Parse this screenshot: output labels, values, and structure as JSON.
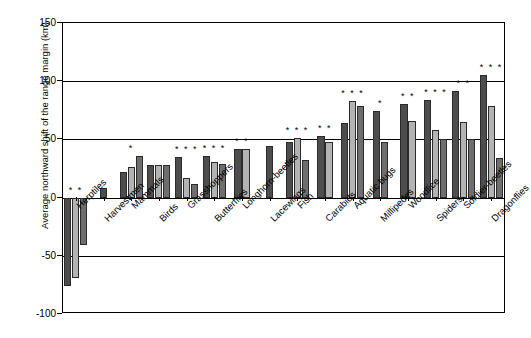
{
  "chart_data": {
    "type": "bar",
    "title": "",
    "xlabel": "",
    "ylabel": "Average northward shift of the range margin (km)",
    "ylim": [
      -100,
      150
    ],
    "yticks": [
      150,
      100,
      50,
      0,
      -50,
      -100
    ],
    "grid": true,
    "legend_position": "none",
    "categories": [
      "Herptiles",
      "Harvestmen",
      "Mammals",
      "Birds",
      "Grasshoppers",
      "Butterflies",
      "Longhorn-beetles",
      "Lacewings",
      "Fish",
      "Carabids",
      "Aquatic bugs",
      "Millipedes",
      "Woodlice",
      "Spiders",
      "Soldier-beetles",
      "Dragonflies"
    ],
    "series": [
      {
        "name": "bar-1",
        "shade": "dark",
        "values": [
          -76,
          8,
          22,
          28,
          35,
          36,
          42,
          44,
          48,
          53,
          64,
          74,
          80,
          84,
          92,
          105
        ]
      },
      {
        "name": "bar-2",
        "shade": "light",
        "values": [
          -69,
          null,
          26,
          28,
          17,
          31,
          42,
          null,
          51,
          48,
          83,
          null,
          66,
          58,
          65,
          79
        ]
      },
      {
        "name": "bar-3",
        "shade": "mid",
        "values": [
          -41,
          null,
          36,
          28,
          12,
          29,
          null,
          null,
          32,
          null,
          79,
          48,
          null,
          50,
          50,
          34
        ]
      }
    ],
    "significance": [
      {
        "category": "Herptiles",
        "marks": "* *"
      },
      {
        "category": "Harvestmen",
        "marks": ""
      },
      {
        "category": "Mammals",
        "marks": "*"
      },
      {
        "category": "Birds",
        "marks": ""
      },
      {
        "category": "Grasshoppers",
        "marks": "* * *"
      },
      {
        "category": "Butterflies",
        "marks": "* * *"
      },
      {
        "category": "Longhorn-beetles",
        "marks": "* *"
      },
      {
        "category": "Lacewings",
        "marks": ""
      },
      {
        "category": "Fish",
        "marks": "* * *"
      },
      {
        "category": "Carabids",
        "marks": "* *"
      },
      {
        "category": "Aquatic bugs",
        "marks": "* * *"
      },
      {
        "category": "Millipedes",
        "marks": "*"
      },
      {
        "category": "Woodlice",
        "marks": "* *"
      },
      {
        "category": "Spiders",
        "marks": "* * *"
      },
      {
        "category": "Soldier-beetles",
        "marks": "* *"
      },
      {
        "category": "Dragonflies",
        "marks": "* * *"
      }
    ],
    "colors": {
      "bar_dark": "#4d4d4d",
      "bar_light": "#b3b3b3",
      "bar_mid": "#6e6e6e",
      "axis": "#000000",
      "background": "#ffffff"
    }
  }
}
